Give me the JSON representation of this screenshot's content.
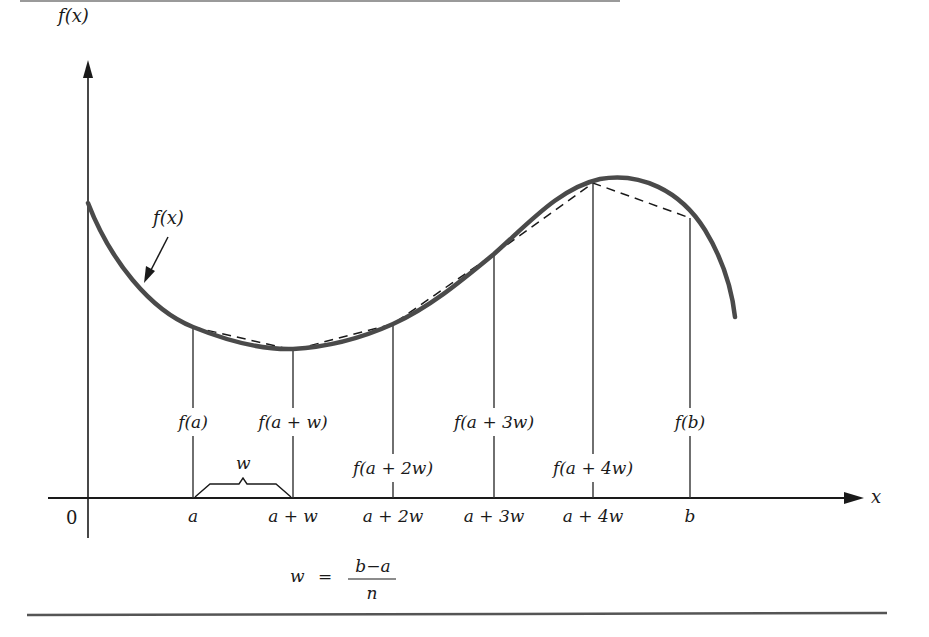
{
  "figure": {
    "type": "trapezoidal-rule-illustration",
    "colors": {
      "curve": "#4a4a4a",
      "axis": "#1a1a1a",
      "ordinate": "#333333",
      "dashed_chord": "#1a1a1a",
      "rule_top": "#9a9a9a",
      "rule_bottom": "#555555",
      "text": "#1a1a1a"
    },
    "y_axis_label": "f(x)",
    "x_axis_label": "x",
    "origin_label": "0",
    "curve_label": "f(x)",
    "width_label": "w",
    "x_ticks": [
      "a",
      "a + w",
      "a + 2w",
      "a + 3w",
      "a + 4w",
      "b"
    ],
    "ordinate_labels": [
      "f(a)",
      "f(a + w)",
      "f(a + 2w)",
      "f(a + 3w)",
      "f(a + 4w)",
      "f(b)"
    ],
    "formula": {
      "lhs": "w",
      "equals": "=",
      "numerator": "b−a",
      "denominator": "n"
    }
  }
}
